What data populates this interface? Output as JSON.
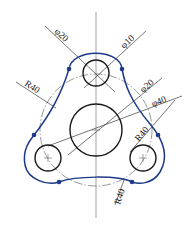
{
  "drawing": {
    "title": "Three-lobe plate with tangent arcs",
    "colors": {
      "profile": "#1d3a86",
      "outline": "#1a1a1a",
      "centerline": "#7a7a7a"
    },
    "dimensions": {
      "top_outer_dia": "φ20",
      "top_hole_dia": "φ10",
      "center_hole_dia": "φ20",
      "center_boss_dia": "φ40",
      "left_arc_radius": "R40",
      "right_arc_radius": "R40",
      "bottom_arc_radius": "R40"
    }
  }
}
